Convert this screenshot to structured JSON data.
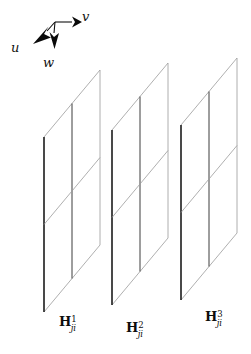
{
  "figure": {
    "type": "diagram",
    "background_color": "#ffffff",
    "line_color": "#8c8c8c",
    "edge_color": "#1a1a1a",
    "text_color": "#0d0d0d"
  },
  "axes": {
    "origin": {
      "x": 55,
      "y": 22
    },
    "arrows": [
      {
        "name": "v",
        "label": "v",
        "tip": {
          "x": 80,
          "y": 22
        },
        "direction": "right"
      },
      {
        "name": "u",
        "label": "u",
        "tip": {
          "x": 33,
          "y": 44
        },
        "direction": "down-left"
      },
      {
        "name": "w",
        "label": "w",
        "tip": {
          "x": 53,
          "y": 50
        },
        "direction": "down"
      }
    ]
  },
  "planes": [
    {
      "id": "plane-1",
      "label_symbol": "H",
      "label_superscript": "1",
      "label_subscript": "ji",
      "rows": 2,
      "cols": 2,
      "geometry": {
        "left_x": 44,
        "mid_x": 72,
        "right_x": 100,
        "top_y_left": 137,
        "bottom_y_left": 312,
        "skew_dy": -67
      }
    },
    {
      "id": "plane-2",
      "label_symbol": "H",
      "label_superscript": "2",
      "label_subscript": "ji",
      "rows": 2,
      "cols": 2,
      "geometry": {
        "left_x": 112,
        "mid_x": 140,
        "right_x": 168,
        "top_y_left": 130,
        "bottom_y_left": 305,
        "skew_dy": -67
      }
    },
    {
      "id": "plane-3",
      "label_symbol": "H",
      "label_superscript": "3",
      "label_subscript": "ji",
      "rows": 2,
      "cols": 2,
      "geometry": {
        "left_x": 181,
        "mid_x": 209,
        "right_x": 237,
        "top_y_left": 125,
        "bottom_y_left": 300,
        "skew_dy": -67
      }
    }
  ],
  "labels": {
    "u": "u",
    "v": "v",
    "w": "w",
    "h1": {
      "symbol": "H",
      "sup": "1",
      "sub": "ji"
    },
    "h2": {
      "symbol": "H",
      "sup": "2",
      "sub": "ji"
    },
    "h3": {
      "symbol": "H",
      "sup": "3",
      "sub": "ji"
    }
  }
}
